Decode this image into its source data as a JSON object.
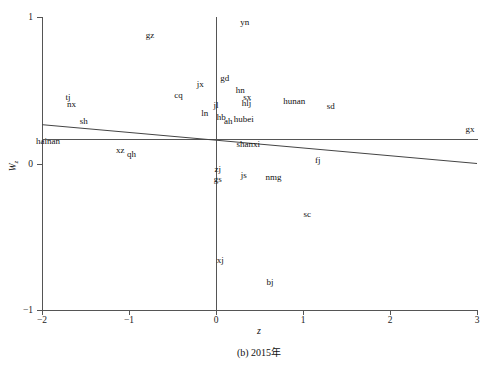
{
  "chart_data": {
    "type": "scatter",
    "title": "",
    "caption": "(b) 2015年",
    "xlabel": "z",
    "ylabel": "W",
    "ylabel_sub": "z",
    "xlim": [
      -2,
      3
    ],
    "ylim": [
      -1,
      1
    ],
    "xticks": [
      -2,
      -1,
      0,
      1,
      2,
      3
    ],
    "xtick_labels": [
      "−2",
      "−1",
      "0",
      "1",
      "2",
      "3"
    ],
    "yticks": [
      -1,
      0,
      1
    ],
    "ytick_labels": [
      "−1",
      "0",
      "1"
    ],
    "grid": false,
    "legend": null,
    "reference_lines": {
      "vertical_x": 0,
      "horizontal_y": 0.17
    },
    "fit_line": {
      "x_start": -2,
      "y_start": 0.265,
      "x_end": 3,
      "y_end": 0.0,
      "description": "fitted regression line"
    },
    "points": [
      {
        "label": "gz",
        "x": -0.76,
        "y": 0.875
      },
      {
        "label": "yn",
        "x": 0.33,
        "y": 0.965
      },
      {
        "label": "gd",
        "x": 0.1,
        "y": 0.585
      },
      {
        "label": "jx",
        "x": -0.18,
        "y": 0.545
      },
      {
        "label": "hn",
        "x": 0.28,
        "y": 0.505
      },
      {
        "label": "cq",
        "x": -0.43,
        "y": 0.47
      },
      {
        "label": "sx",
        "x": 0.36,
        "y": 0.455
      },
      {
        "label": "tj",
        "x": -1.7,
        "y": 0.455
      },
      {
        "label": "hlj",
        "x": 0.35,
        "y": 0.415
      },
      {
        "label": "hunan",
        "x": 0.9,
        "y": 0.425
      },
      {
        "label": "sd",
        "x": 1.32,
        "y": 0.395
      },
      {
        "label": "nx",
        "x": -1.66,
        "y": 0.405
      },
      {
        "label": "jl",
        "x": 0.0,
        "y": 0.4
      },
      {
        "label": "ln",
        "x": -0.13,
        "y": 0.345
      },
      {
        "label": "hb",
        "x": 0.06,
        "y": 0.32
      },
      {
        "label": "ah",
        "x": 0.14,
        "y": 0.29
      },
      {
        "label": "hubei",
        "x": 0.32,
        "y": 0.305
      },
      {
        "label": "gx",
        "x": 2.92,
        "y": 0.235
      },
      {
        "label": "sh",
        "x": -1.52,
        "y": 0.29
      },
      {
        "label": "shanxi",
        "x": 0.37,
        "y": 0.13
      },
      {
        "label": "hainan",
        "x": -1.93,
        "y": 0.155
      },
      {
        "label": "xz",
        "x": -1.1,
        "y": 0.095
      },
      {
        "label": "qh",
        "x": -0.97,
        "y": 0.065
      },
      {
        "label": "fj",
        "x": 1.17,
        "y": 0.025
      },
      {
        "label": "zj",
        "x": 0.02,
        "y": -0.035
      },
      {
        "label": "js",
        "x": 0.32,
        "y": -0.08
      },
      {
        "label": "nmg",
        "x": 0.66,
        "y": -0.09
      },
      {
        "label": "gs",
        "x": 0.02,
        "y": -0.105
      },
      {
        "label": "sc",
        "x": 1.05,
        "y": -0.345
      },
      {
        "label": "xj",
        "x": 0.05,
        "y": -0.66
      },
      {
        "label": "bj",
        "x": 0.62,
        "y": -0.81
      }
    ]
  }
}
